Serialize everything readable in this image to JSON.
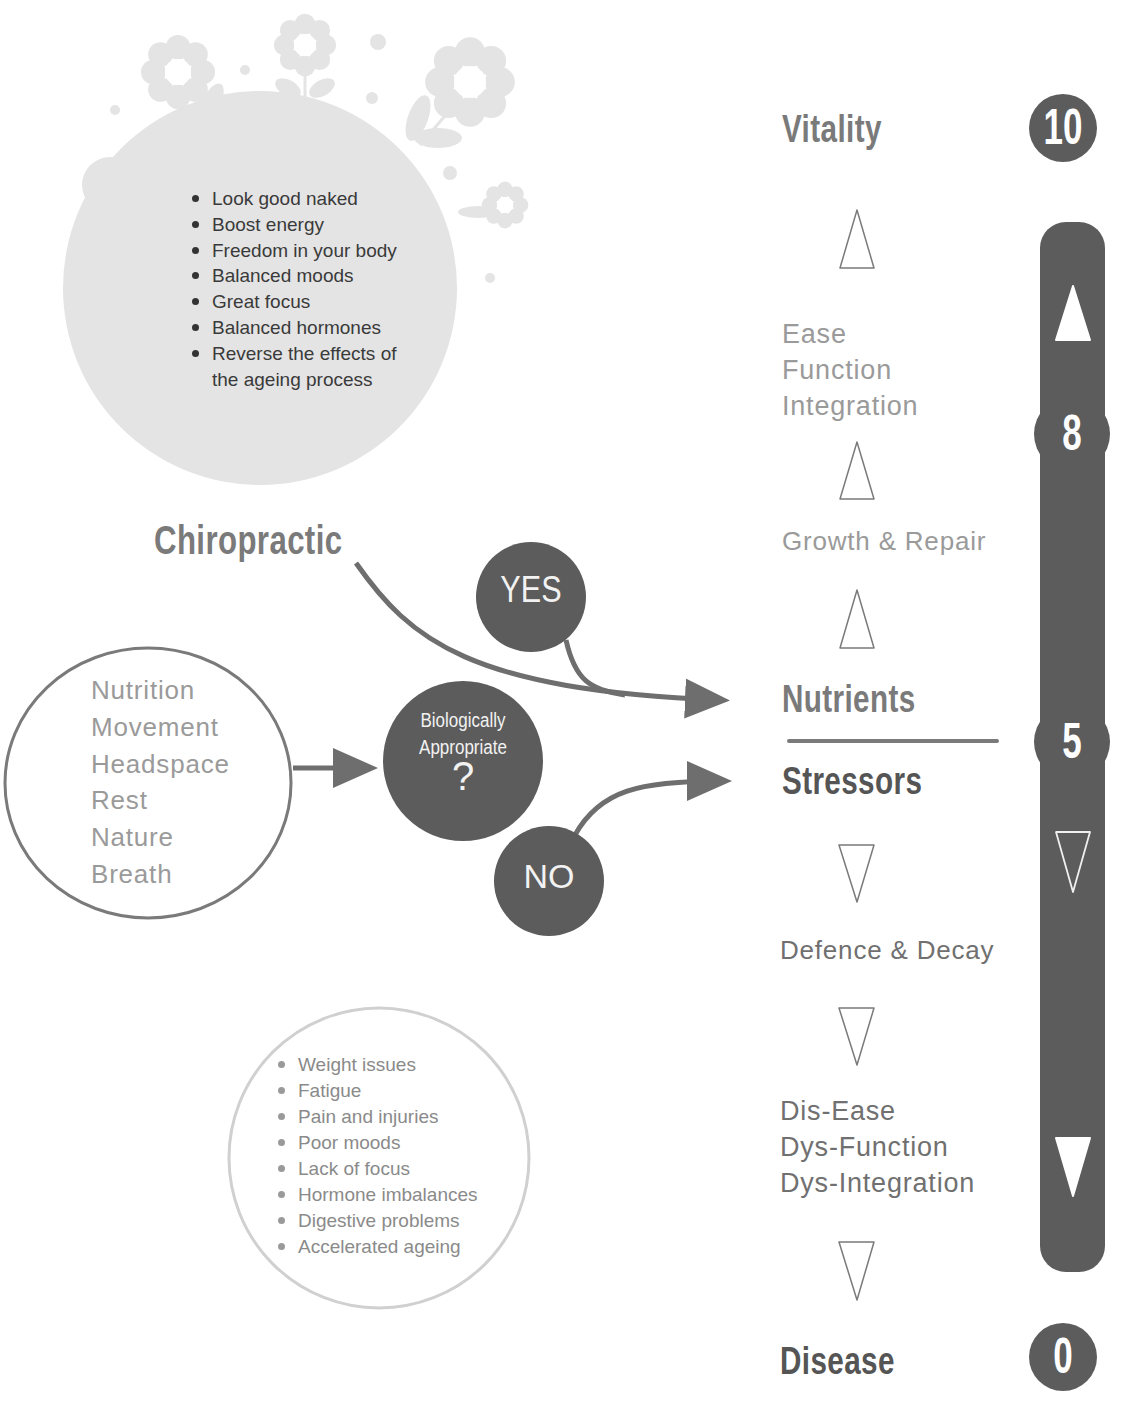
{
  "benefits_bubble": {
    "items": [
      "Look good naked",
      "Boost energy",
      "Freedom in your body",
      "Balanced moods",
      "Great focus",
      "Balanced hormones",
      "Reverse the effects of",
      "the ageing process"
    ]
  },
  "symptoms_bubble": {
    "items": [
      "Weight issues",
      "Fatigue",
      "Pain and injuries",
      "Poor moods",
      "Lack of focus",
      "Hormone imbalances",
      "Digestive problems",
      "Accelerated ageing"
    ]
  },
  "inputs_circle": {
    "items": [
      "Nutrition",
      "Movement",
      "Headspace",
      "Rest",
      "Nature",
      "Breath"
    ]
  },
  "chiropractic_label": "Chiropractic",
  "decision": {
    "line1": "Biologically",
    "line2": "Appropriate",
    "mark": "?",
    "yes": "YES",
    "no": "NO"
  },
  "ladder": {
    "top": "Vitality",
    "ease_lines": [
      "Ease",
      "Function",
      "Integration"
    ],
    "growth": "Growth & Repair",
    "nutrients": "Nutrients",
    "stressors": "Stressors",
    "defence": "Defence & Decay",
    "dis_lines": [
      "Dis-Ease",
      "Dys-Function",
      "Dys-Integration"
    ],
    "bottom": "Disease"
  },
  "scale": {
    "top_value": "10",
    "upper_value": "8",
    "mid_value": "5",
    "bottom_value": "0"
  },
  "colors": {
    "dark_fill": "#5c5c5c",
    "circle_stroke": "#7a7a7a",
    "light_bubble": "#e4e4e4",
    "symptom_ring": "#cfcfcf"
  }
}
